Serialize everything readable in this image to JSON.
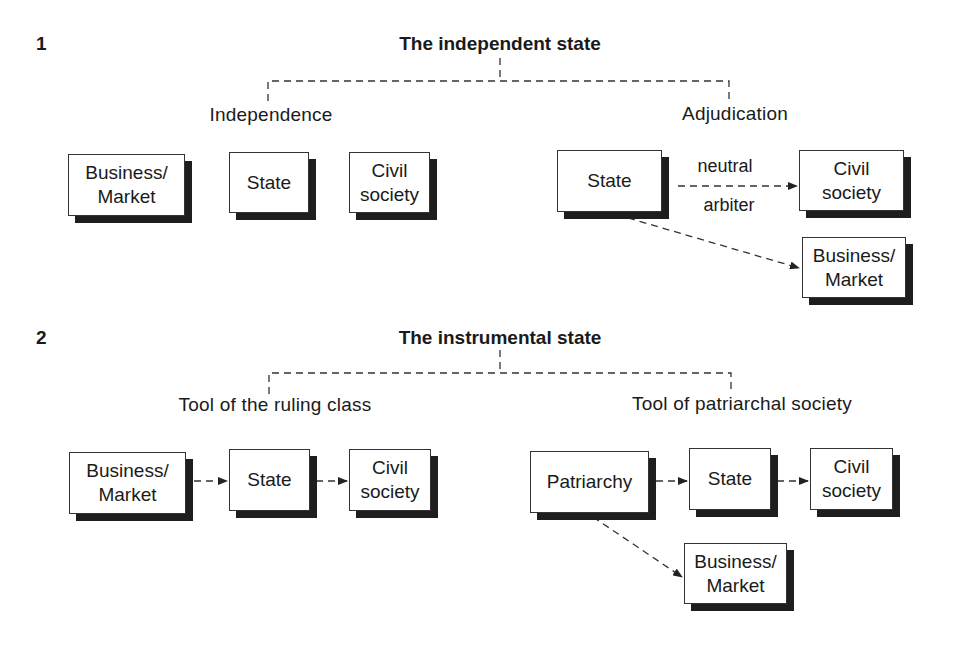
{
  "sections": [
    {
      "number": "1",
      "title": "The independent state",
      "branches": [
        {
          "label": "Independence",
          "boxes": [
            "Business/\nMarket",
            "State",
            "Civil\nsociety"
          ]
        },
        {
          "label": "Adjudication",
          "boxes": [
            "State",
            "Civil\nsociety",
            "Business/\nMarket"
          ],
          "edge_labels": [
            "neutral",
            "arbiter"
          ]
        }
      ]
    },
    {
      "number": "2",
      "title": "The instrumental state",
      "branches": [
        {
          "label": "Tool of the ruling class",
          "boxes": [
            "Business/\nMarket",
            "State",
            "Civil\nsociety"
          ]
        },
        {
          "label": "Tool of patriarchal society",
          "boxes": [
            "Patriarchy",
            "State",
            "Civil\nsociety",
            "Business/\nMarket"
          ]
        }
      ]
    }
  ],
  "colors": {
    "line": "#333333",
    "shadow": "#1e1e1e",
    "background": "#ffffff"
  }
}
